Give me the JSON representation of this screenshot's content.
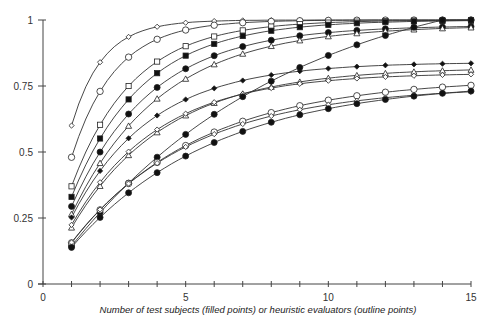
{
  "chart_data": {
    "type": "scatter",
    "title": "",
    "xlabel": "Number of test subjects (filled points) or heuristic evaluators (outline points)",
    "ylabel": "",
    "xlim": [
      0,
      15
    ],
    "ylim": [
      0,
      1
    ],
    "x_ticks": [
      "0",
      "5",
      "10",
      "15"
    ],
    "y_ticks": [
      "0",
      "0.25",
      "0.5",
      "0.75",
      "1"
    ],
    "grid": false,
    "series": [
      {
        "name": "heuristic-diamond-top",
        "filled": false,
        "marker": "diamond",
        "asymptote": 1.0,
        "lambda": 0.6
      },
      {
        "name": "heuristic-circle-a",
        "filled": false,
        "marker": "circle",
        "asymptote": 1.0,
        "lambda": 0.48
      },
      {
        "name": "heuristic-square",
        "filled": false,
        "marker": "square",
        "asymptote": 1.0,
        "lambda": 0.37
      },
      {
        "name": "test-square",
        "filled": true,
        "marker": "square",
        "asymptote": 1.0,
        "lambda": 0.33
      },
      {
        "name": "test-circle-a",
        "filled": true,
        "marker": "circle",
        "asymptote": 0.98,
        "lambda": 0.3
      },
      {
        "name": "heuristic-triangle-a",
        "filled": false,
        "marker": "triangle",
        "asymptote": 0.98,
        "lambda": 0.27
      },
      {
        "name": "test-diamond",
        "filled": true,
        "marker": "diamond",
        "asymptote": 0.84,
        "lambda": 0.3
      },
      {
        "name": "heuristic-triangle-b",
        "filled": false,
        "marker": "triangle",
        "asymptote": 0.82,
        "lambda": 0.26
      },
      {
        "name": "heuristic-diamond-b",
        "filled": false,
        "marker": "diamond",
        "asymptote": 0.8,
        "lambda": 0.28
      },
      {
        "name": "test-circle-b",
        "filled": true,
        "marker": "circle",
        "asymptote": 1.2,
        "lambda": 0.12
      },
      {
        "name": "heuristic-circle-b",
        "filled": false,
        "marker": "circle",
        "asymptote": 0.78,
        "lambda": 0.2
      },
      {
        "name": "heuristic-diamond-c",
        "filled": false,
        "marker": "diamond",
        "asymptote": 0.75,
        "lambda": 0.21
      },
      {
        "name": "test-circle-c",
        "filled": true,
        "marker": "circle",
        "asymptote": 0.77,
        "lambda": 0.18
      }
    ]
  }
}
